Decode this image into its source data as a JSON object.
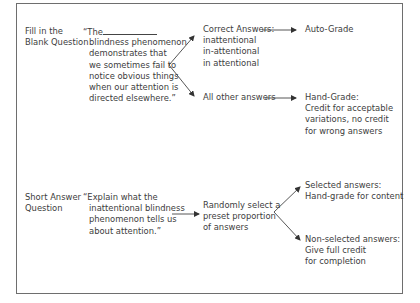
{
  "diagram": {
    "rows": [
      {
        "label": [
          "Fill in the",
          "Blank Question"
        ],
        "question_prefix": "“The",
        "question_lines": [
          "blindness phenomenon",
          "demonstrates that",
          "we sometimes fail to",
          "notice obvious things",
          "when our attention is",
          "directed elsewhere.”"
        ],
        "branches": [
          {
            "condition": [
              "Correct Answers:",
              "inattentional",
              "in-attentional",
              "in attentional"
            ],
            "outcome": [
              "Auto-Grade"
            ]
          },
          {
            "condition": [
              "All other answers"
            ],
            "outcome": [
              "Hand-Grade:",
              "Credit for acceptable",
              "variations, no credit",
              "for wrong answers"
            ]
          }
        ]
      },
      {
        "label": [
          "Short Answer",
          "Question"
        ],
        "question_lines": [
          "“Explain what the",
          "inattentional blindness",
          "phenomenon tells us",
          "about attention.”"
        ],
        "step": [
          "Randomly select a",
          "preset proportion",
          "of answers"
        ],
        "branches": [
          {
            "outcome": [
              "Selected answers:",
              "Hand-grade for content"
            ]
          },
          {
            "outcome": [
              "Non-selected answers:",
              "Give full credit",
              "for completion"
            ]
          }
        ]
      }
    ],
    "colors": {
      "border": "#6e6e6e",
      "text": "#3c3c3c",
      "arrow": "#333333"
    }
  }
}
